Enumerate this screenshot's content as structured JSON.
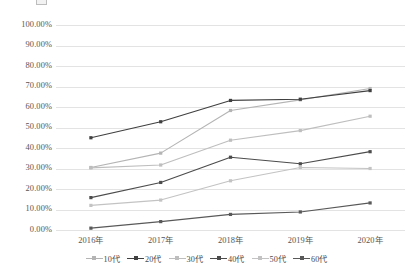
{
  "chart_data": {
    "type": "line",
    "title": "",
    "subtitle": "",
    "xlabel": "",
    "ylabel": "",
    "categories": [
      "2016年",
      "2017年",
      "2018年",
      "2019年",
      "2020年"
    ],
    "ylim": [
      0,
      100
    ],
    "ytick_step": 10,
    "ytick_labels": [
      "0.00%",
      "10.00%",
      "20.00%",
      "30.00%",
      "40.00%",
      "50.00%",
      "60.00%",
      "70.00%",
      "80.00%",
      "90.00%",
      "100.00%"
    ],
    "ytick_values": [
      0,
      10,
      20,
      30,
      40,
      50,
      60,
      70,
      80,
      90,
      100
    ],
    "grid": true,
    "grid_axis": "y",
    "legend_position": "bottom",
    "value_unit": "percent",
    "series": [
      {
        "name": "10代",
        "values": [
          30.5,
          37.5,
          58.3,
          63.5,
          69.0
        ],
        "color": "#b4b4b4",
        "marker": "square"
      },
      {
        "name": "20代",
        "values": [
          45.0,
          52.8,
          63.2,
          63.8,
          68.0
        ],
        "color": "#404040",
        "marker": "square"
      },
      {
        "name": "30代",
        "values": [
          30.3,
          31.7,
          43.8,
          48.5,
          55.5
        ],
        "color": "#bebebe",
        "marker": "square"
      },
      {
        "name": "40代",
        "values": [
          15.8,
          23.2,
          35.5,
          32.3,
          38.2
        ],
        "color": "#4c4c4c",
        "marker": "square"
      },
      {
        "name": "50代",
        "values": [
          12.0,
          14.6,
          24.0,
          30.5,
          30.0
        ],
        "color": "#c3c3c3",
        "marker": "square"
      },
      {
        "name": "60代",
        "values": [
          0.9,
          4.1,
          7.6,
          8.8,
          13.2
        ],
        "color": "#595959",
        "marker": "square"
      }
    ]
  },
  "legend": {
    "items": [
      {
        "label": "10代"
      },
      {
        "label": "20代"
      },
      {
        "label": "30代"
      },
      {
        "label": "40代"
      },
      {
        "label": "50代"
      },
      {
        "label": "60代"
      }
    ]
  }
}
